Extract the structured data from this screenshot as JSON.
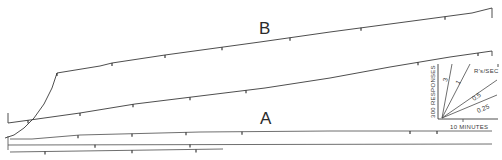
{
  "chart_data": {
    "type": "line",
    "title": "",
    "series": [
      {
        "name": "B",
        "points": [
          [
            5,
            138
          ],
          [
            14,
            135
          ],
          [
            24,
            128
          ],
          [
            34,
            118
          ],
          [
            44,
            104
          ],
          [
            52,
            88
          ],
          [
            57,
            73
          ],
          [
            100,
            66
          ],
          [
            112,
            63
          ],
          [
            165,
            55
          ],
          [
            260,
            42
          ],
          [
            330,
            32
          ],
          [
            420,
            20
          ],
          [
            472,
            13
          ],
          [
            492,
            8
          ],
          [
            492,
            18
          ]
        ],
        "tick_marks_x": [
          57,
          112,
          165,
          222,
          290,
          361,
          445
        ]
      },
      {
        "name": "A",
        "points": [
          [
            8,
            113
          ],
          [
            8,
            123
          ],
          [
            30,
            120
          ],
          [
            80,
            113
          ],
          [
            135,
            104
          ],
          [
            200,
            96
          ],
          [
            265,
            88
          ],
          [
            330,
            78
          ],
          [
            390,
            67
          ],
          [
            450,
            57
          ],
          [
            492,
            51
          ],
          [
            492,
            56
          ]
        ],
        "tick_marks_x": [
          28,
          80,
          133,
          190,
          246,
          418,
          478
        ]
      }
    ],
    "baselines": [
      {
        "points": [
          [
            10,
            139
          ],
          [
            32,
            139
          ],
          [
            80,
            135
          ],
          [
            200,
            132
          ],
          [
            330,
            131
          ],
          [
            492,
            131
          ]
        ],
        "tick_marks_x": [
          78,
          132,
          186,
          242,
          410,
          437
        ]
      },
      {
        "points": [
          [
            8,
            145
          ],
          [
            492,
            144
          ]
        ],
        "tick_marks_x": [
          95,
          190
        ]
      },
      {
        "points": [
          [
            10,
            152
          ],
          [
            223,
            149
          ]
        ],
        "tick_marks_x": [
          45,
          132,
          196
        ]
      }
    ],
    "labels": {
      "curve_b": "B",
      "curve_a": "A"
    },
    "key": {
      "ylabel": "300 RESPONSES",
      "xlabel": "10 MINUTES",
      "title": "R's/SEC",
      "rates": [
        "3",
        "1",
        "0.5",
        "0.25"
      ]
    },
    "xlabel": "",
    "ylabel": "",
    "grid": false,
    "legend_position": "inset lower-right"
  }
}
